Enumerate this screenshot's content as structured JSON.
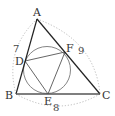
{
  "figure": {
    "type": "geometry",
    "vertices": {
      "A": "A",
      "B": "B",
      "C": "C"
    },
    "tangent_points": {
      "D": "D",
      "E": "E",
      "F": "F"
    },
    "side_lengths": {
      "AB": "7",
      "BC": "8",
      "CA": "9"
    },
    "colors": {
      "triangle": "#222222",
      "incircle": "#777777",
      "contact_triangle": "#555555",
      "arcs": "#bbbbbb",
      "labels": "#333333"
    }
  }
}
